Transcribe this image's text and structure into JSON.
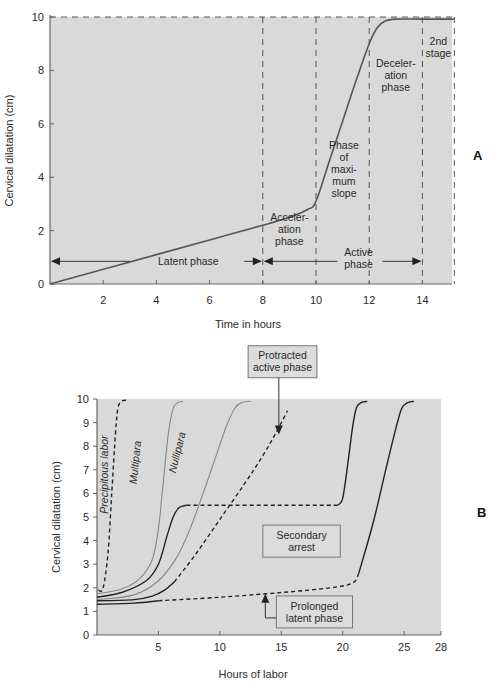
{
  "panels": {
    "A": {
      "letter": "A"
    },
    "B": {
      "letter": "B"
    }
  },
  "chart_data": [
    {
      "id": "A",
      "type": "line",
      "title": "",
      "xlabel": "Time in hours",
      "ylabel": "Cervical dilatation (cm)",
      "xlim": [
        0,
        15.2
      ],
      "ylim": [
        0,
        10
      ],
      "xticks": [
        2,
        4,
        6,
        8,
        10,
        12,
        14
      ],
      "yticks": [
        0,
        2,
        4,
        6,
        8,
        10
      ],
      "grid": false,
      "background": "#d9d9d9",
      "series": [
        {
          "name": "Labor curve",
          "style": "solid",
          "color": "#555555",
          "points": [
            [
              0,
              0
            ],
            [
              2,
              0.55
            ],
            [
              4,
              1.1
            ],
            [
              6,
              1.65
            ],
            [
              8,
              2.2
            ],
            [
              9,
              2.5
            ],
            [
              9.7,
              2.8
            ],
            [
              10,
              3.1
            ],
            [
              10.5,
              4.6
            ],
            [
              11,
              6.1
            ],
            [
              11.5,
              7.6
            ],
            [
              12,
              9.0
            ],
            [
              12.3,
              9.6
            ],
            [
              12.6,
              9.85
            ],
            [
              13,
              9.92
            ],
            [
              14,
              9.92
            ],
            [
              15.2,
              9.92
            ]
          ]
        }
      ],
      "reference_lines": {
        "horizontal_dashed_at": 10,
        "vertical_dashed_at": [
          8,
          10,
          12,
          14,
          15.2
        ]
      },
      "annotations": [
        {
          "text": [
            "Latent phase"
          ],
          "x": 5.2,
          "y": 0.85
        },
        {
          "text": [
            "Acceler-",
            "ation",
            "phase"
          ],
          "x": 9.0,
          "y": 2.05
        },
        {
          "text": [
            "Phase",
            "of",
            "maxi-",
            "mum",
            "slope"
          ],
          "x": 11.05,
          "y": 4.3
        },
        {
          "text": [
            "Deceler-",
            "ation",
            "phase"
          ],
          "x": 13.0,
          "y": 7.8
        },
        {
          "text": [
            "2nd",
            "stage"
          ],
          "x": 14.6,
          "y": 8.85
        },
        {
          "text": [
            "Active",
            "phase"
          ],
          "x": 11.6,
          "y": 0.95
        }
      ],
      "arrows": [
        {
          "name": "latent-phase-arrow",
          "from": 8,
          "to": 0,
          "y": 0.85,
          "label_gap": [
            3.0,
            7.3
          ]
        },
        {
          "name": "active-phase-arrow",
          "from": 8,
          "to": 14,
          "y": 0.85,
          "label_gap": [
            10.8,
            12.5
          ]
        }
      ]
    },
    {
      "id": "B",
      "type": "line",
      "title": "",
      "xlabel": "Hours of labor",
      "ylabel": "Cervical dilatation (cm)",
      "xlim": [
        0,
        28
      ],
      "ylim": [
        0,
        10
      ],
      "xticks": [
        5,
        10,
        15,
        20,
        25,
        28
      ],
      "yticks": [
        0,
        1,
        2,
        3,
        4,
        5,
        6,
        7,
        8,
        9,
        10
      ],
      "grid": false,
      "background": "#d9d9d9",
      "series": [
        {
          "name": "Precipitous labor",
          "style": "dashed",
          "color": "#222222",
          "points": [
            [
              0.1,
              1.9
            ],
            [
              0.5,
              2.0
            ],
            [
              0.9,
              3.5
            ],
            [
              1.2,
              6.0
            ],
            [
              1.5,
              8.5
            ],
            [
              1.7,
              9.6
            ],
            [
              2.0,
              9.9
            ],
            [
              2.4,
              9.95
            ]
          ]
        },
        {
          "name": "Multipara",
          "style": "solid",
          "color": "#888888",
          "points": [
            [
              0,
              1.75
            ],
            [
              2,
              1.95
            ],
            [
              3.5,
              2.4
            ],
            [
              4.5,
              3.2
            ],
            [
              5.0,
              4.5
            ],
            [
              5.4,
              6.5
            ],
            [
              5.8,
              8.5
            ],
            [
              6.2,
              9.6
            ],
            [
              6.6,
              9.85
            ],
            [
              7.0,
              9.9
            ]
          ]
        },
        {
          "name": "Nullipara",
          "style": "solid",
          "color": "#888888",
          "points": [
            [
              0,
              1.5
            ],
            [
              3,
              1.7
            ],
            [
              5,
              2.3
            ],
            [
              6.5,
              3.3
            ],
            [
              7.5,
              4.4
            ],
            [
              8.5,
              5.8
            ],
            [
              9.5,
              7.3
            ],
            [
              10.5,
              8.8
            ],
            [
              11.2,
              9.6
            ],
            [
              11.8,
              9.85
            ],
            [
              12.5,
              9.9
            ]
          ]
        },
        {
          "name": "Secondary arrest (early)",
          "style": "solid",
          "color": "#222222",
          "points": [
            [
              0,
              1.6
            ],
            [
              2,
              1.8
            ],
            [
              4,
              2.3
            ],
            [
              5,
              3.0
            ],
            [
              5.7,
              4.2
            ],
            [
              6.2,
              5.0
            ],
            [
              6.7,
              5.4
            ],
            [
              7.3,
              5.5
            ]
          ]
        },
        {
          "name": "Secondary arrest (plateau)",
          "style": "dashed",
          "color": "#222222",
          "points": [
            [
              7.3,
              5.5
            ],
            [
              10,
              5.5
            ],
            [
              15,
              5.5
            ],
            [
              19.6,
              5.5
            ]
          ]
        },
        {
          "name": "Secondary arrest (resume)",
          "style": "solid",
          "color": "#222222",
          "points": [
            [
              19.6,
              5.5
            ],
            [
              20.0,
              5.8
            ],
            [
              20.4,
              7.2
            ],
            [
              20.8,
              8.8
            ],
            [
              21.1,
              9.6
            ],
            [
              21.5,
              9.85
            ],
            [
              22.0,
              9.9
            ]
          ]
        },
        {
          "name": "Protracted active phase (early)",
          "style": "solid",
          "color": "#222222",
          "points": [
            [
              0,
              1.45
            ],
            [
              3,
              1.5
            ],
            [
              4.5,
              1.65
            ],
            [
              5.5,
              1.9
            ],
            [
              6.3,
              2.25
            ]
          ]
        },
        {
          "name": "Protracted active phase",
          "style": "dashed",
          "color": "#222222",
          "points": [
            [
              6.3,
              2.25
            ],
            [
              8,
              3.4
            ],
            [
              10,
              4.9
            ],
            [
              12,
              6.4
            ],
            [
              13.5,
              7.6
            ],
            [
              14.6,
              8.6
            ],
            [
              15.5,
              9.5
            ]
          ]
        },
        {
          "name": "Prolonged latent phase (early)",
          "style": "solid",
          "color": "#222222",
          "points": [
            [
              0,
              1.3
            ],
            [
              3,
              1.35
            ],
            [
              5,
              1.45
            ]
          ]
        },
        {
          "name": "Prolonged latent phase",
          "style": "dashed",
          "color": "#222222",
          "points": [
            [
              5,
              1.45
            ],
            [
              10,
              1.6
            ],
            [
              15,
              1.8
            ],
            [
              19,
              2.0
            ],
            [
              20.8,
              2.2
            ],
            [
              21.3,
              2.6
            ]
          ]
        },
        {
          "name": "Prolonged latent phase (active)",
          "style": "solid",
          "color": "#222222",
          "points": [
            [
              21.3,
              2.6
            ],
            [
              22.5,
              4.8
            ],
            [
              23.5,
              7.0
            ],
            [
              24.3,
              8.7
            ],
            [
              24.8,
              9.6
            ],
            [
              25.3,
              9.85
            ],
            [
              25.8,
              9.9
            ]
          ]
        }
      ],
      "annotations": [
        {
          "text": [
            "Precipitous labor"
          ],
          "x": 0.9,
          "y": 6.8,
          "rotate": -90
        },
        {
          "text": [
            "Multipara"
          ],
          "x": 3.4,
          "y": 7.3,
          "rotate": -84
        },
        {
          "text": [
            "Nullipara"
          ],
          "x": 6.8,
          "y": 7.7,
          "rotate": -76
        }
      ],
      "callouts": [
        {
          "text": [
            "Protracted",
            "active phase"
          ],
          "box": [
            12.3,
            10.9,
            5.6
          ],
          "arrow_to": [
            14.8,
            8.5
          ],
          "arrow_from_y": 10.9
        },
        {
          "text": [
            "Secondary",
            "arrest"
          ],
          "box": [
            13.5,
            3.3,
            6.3
          ],
          "arrow_to": [
            16.0,
            5.4
          ],
          "arrow_from_y": 4.4
        },
        {
          "text": [
            "Prolonged",
            "latent phase"
          ],
          "box": [
            14.6,
            0.3,
            6.2
          ],
          "arrow_to": [
            13.7,
            1.75
          ],
          "arrow_from_y": 0.95,
          "elbow": true
        }
      ]
    }
  ]
}
